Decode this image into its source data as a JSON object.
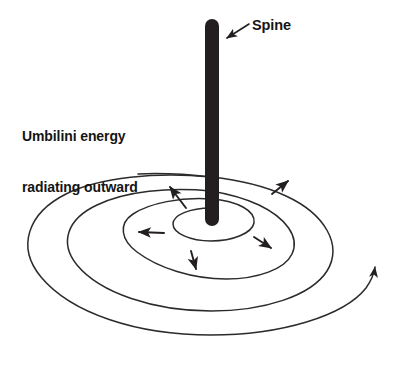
{
  "diagram": {
    "type": "concept-diagram",
    "background_color": "#ffffff",
    "stroke_color": "#2b2b2b",
    "spine_color": "#231f20",
    "text_color": "#151515"
  },
  "labels": {
    "spine": "Spine",
    "umbilini_line1": "Umbilini energy",
    "umbilini_line2": "radiating outward"
  },
  "elements": {
    "spine_bar": {
      "name": "spine",
      "shape": "rounded-vertical-bar",
      "x": 205,
      "y": 19,
      "width": 14,
      "height": 207,
      "color": "#231f20"
    },
    "spiral": {
      "name": "umbilini-energy-spiral",
      "turns": 3,
      "center_x": 211,
      "center_y": 224,
      "ellipse_ratio": 0.62,
      "outermost_half_width": 193,
      "innermost_half_width": 42,
      "has_terminal_arrowhead": true,
      "terminal_arrow_x": 372,
      "terminal_arrow_y": 294
    }
  },
  "radiating_arrows": [
    {
      "name": "arrow-up-left",
      "x1": 186,
      "y1": 208,
      "x2": 168,
      "y2": 184
    },
    {
      "name": "arrow-left",
      "x1": 164,
      "y1": 233,
      "x2": 135,
      "y2": 232
    },
    {
      "name": "arrow-down",
      "x1": 191,
      "y1": 251,
      "x2": 197,
      "y2": 273
    },
    {
      "name": "arrow-down-right",
      "x1": 254,
      "y1": 237,
      "x2": 274,
      "y2": 251
    },
    {
      "name": "arrow-up-right",
      "x1": 272,
      "y1": 194,
      "x2": 291,
      "y2": 178
    }
  ],
  "spine_callout": {
    "name": "spine-leader-arrow",
    "x1": 249,
    "y1": 24,
    "x2": 224,
    "y2": 40
  }
}
